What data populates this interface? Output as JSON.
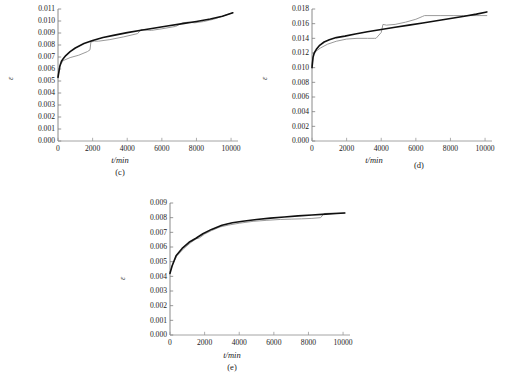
{
  "figure": {
    "background": "#ffffff",
    "curve_colors": {
      "fitted": "#101010",
      "experimental": "#9a9a9a"
    },
    "footer_note": ""
  },
  "chart_data": [
    {
      "id": "c",
      "type": "line",
      "title": "",
      "panel_label": "(c)",
      "xlabel": "t/min",
      "ylabel": "ε",
      "xlim": [
        0,
        10400
      ],
      "ylim": [
        0,
        0.011
      ],
      "grid": false,
      "legend": "none",
      "xticks": [
        0,
        2000,
        4000,
        6000,
        8000,
        10000
      ],
      "xticklabels": [
        "0",
        "2000",
        "4000",
        "6000",
        "8000",
        "10000"
      ],
      "yticks": [
        0,
        0.001,
        0.002,
        0.003,
        0.004,
        0.005,
        0.006,
        0.007,
        0.008,
        0.009,
        0.01,
        0.011
      ],
      "yticklabels": [
        "0.000",
        "0.001",
        "0.002",
        "0.003",
        "0.004",
        "0.005",
        "0.006",
        "0.007",
        "0.008",
        "0.009",
        "0.010",
        "0.011"
      ],
      "series": [
        {
          "name": "experimental",
          "color": "#9a9a9a",
          "x": [
            0,
            120,
            300,
            700,
            1200,
            1700,
            1850,
            1900,
            2100,
            2350,
            3000,
            3800,
            4600,
            4800,
            5000,
            5400,
            6000,
            6800,
            7200,
            7500,
            7900,
            8400,
            9000,
            9600,
            10100
          ],
          "y": [
            0.0054,
            0.0063,
            0.0067,
            0.00695,
            0.00715,
            0.00745,
            0.0076,
            0.00825,
            0.00832,
            0.00832,
            0.00845,
            0.00868,
            0.00895,
            0.0093,
            0.00925,
            0.00922,
            0.00935,
            0.00955,
            0.00985,
            0.0099,
            0.00985,
            0.00995,
            0.01015,
            0.01045,
            0.01068
          ]
        },
        {
          "name": "fitted",
          "color": "#101010",
          "x": [
            0,
            100,
            200,
            300,
            450,
            700,
            1000,
            1500,
            2000,
            2600,
            3200,
            4000,
            4800,
            5600,
            6400,
            7200,
            8000,
            8800,
            9500,
            10100
          ],
          "y": [
            0.0053,
            0.0062,
            0.00665,
            0.00685,
            0.00712,
            0.00745,
            0.00775,
            0.00812,
            0.00838,
            0.00862,
            0.0088,
            0.00903,
            0.00923,
            0.00942,
            0.0096,
            0.00978,
            0.00996,
            0.01016,
            0.0104,
            0.01068
          ]
        }
      ]
    },
    {
      "id": "d",
      "type": "line",
      "title": "",
      "panel_label": "(d)",
      "xlabel": "t/min",
      "ylabel": "ε",
      "xlim": [
        0,
        10400
      ],
      "ylim": [
        0,
        0.018
      ],
      "grid": false,
      "legend": "none",
      "xticks": [
        0,
        2000,
        4000,
        6000,
        8000,
        10000
      ],
      "xticklabels": [
        "0",
        "2000",
        "4000",
        "6000",
        "8000",
        "10000"
      ],
      "yticks": [
        0,
        0.002,
        0.004,
        0.006,
        0.008,
        0.01,
        0.012,
        0.014,
        0.016,
        0.018
      ],
      "yticklabels": [
        "0.000",
        "0.002",
        "0.004",
        "0.006",
        "0.008",
        "0.010",
        "0.012",
        "0.014",
        "0.016",
        "0.018"
      ],
      "series": [
        {
          "name": "experimental",
          "color": "#9a9a9a",
          "x": [
            0,
            80,
            200,
            500,
            900,
            1400,
            2000,
            2600,
            3200,
            3600,
            3700,
            4000,
            4100,
            4300,
            4800,
            5400,
            6000,
            6400,
            6500,
            6700,
            7400,
            8200,
            9000,
            9700,
            10100
          ],
          "y": [
            0.0103,
            0.0119,
            0.0122,
            0.0127,
            0.0132,
            0.0136,
            0.0139,
            0.014,
            0.014,
            0.014,
            0.014,
            0.0148,
            0.0159,
            0.0158,
            0.0159,
            0.0162,
            0.0166,
            0.017,
            0.0171,
            0.0171,
            0.0171,
            0.0171,
            0.0171,
            0.0171,
            0.0171
          ]
        },
        {
          "name": "fitted",
          "color": "#101010",
          "x": [
            0,
            60,
            130,
            250,
            420,
            700,
            1000,
            1400,
            1900,
            2500,
            3200,
            4000,
            4800,
            5600,
            6400,
            7200,
            8000,
            8800,
            9500,
            10100
          ],
          "y": [
            0.01,
            0.0114,
            0.012,
            0.0125,
            0.013,
            0.0135,
            0.0138,
            0.0141,
            0.0143,
            0.0146,
            0.0149,
            0.0152,
            0.0155,
            0.0158,
            0.0161,
            0.0164,
            0.0167,
            0.017,
            0.0173,
            0.0176
          ]
        }
      ]
    },
    {
      "id": "e",
      "type": "line",
      "title": "",
      "panel_label": "(e)",
      "xlabel": "t/min",
      "ylabel": "ε",
      "xlim": [
        0,
        10400
      ],
      "ylim": [
        0,
        0.009
      ],
      "grid": false,
      "legend": "none",
      "xticks": [
        0,
        2000,
        4000,
        6000,
        8000,
        10000
      ],
      "xticklabels": [
        "0",
        "2000",
        "4000",
        "6000",
        "8000",
        "10000"
      ],
      "yticks": [
        0,
        0.001,
        0.002,
        0.003,
        0.004,
        0.005,
        0.006,
        0.007,
        0.008,
        0.009
      ],
      "yticklabels": [
        "0.000",
        "0.001",
        "0.002",
        "0.003",
        "0.004",
        "0.005",
        "0.006",
        "0.007",
        "0.008",
        "0.009"
      ],
      "series": [
        {
          "name": "experimental",
          "color": "#9a9a9a",
          "x": [
            0,
            150,
            400,
            800,
            1200,
            1500,
            1700,
            2000,
            2400,
            2900,
            3400,
            4000,
            4800,
            5600,
            6400,
            7000,
            7600,
            8200,
            8700,
            8900,
            9200,
            9700,
            10100
          ],
          "y": [
            0.0043,
            0.0048,
            0.0054,
            0.0059,
            0.0063,
            0.00655,
            0.00662,
            0.00688,
            0.00712,
            0.00737,
            0.0075,
            0.00762,
            0.00775,
            0.00782,
            0.00788,
            0.0079,
            0.00792,
            0.00795,
            0.008,
            0.00828,
            0.0083,
            0.00831,
            0.00832
          ]
        },
        {
          "name": "fitted",
          "color": "#101010",
          "x": [
            0,
            120,
            350,
            700,
            1100,
            1500,
            1900,
            2400,
            3000,
            3600,
            4200,
            5000,
            5800,
            6600,
            7400,
            8200,
            9000,
            9600,
            10100
          ],
          "y": [
            0.0042,
            0.0047,
            0.0054,
            0.0059,
            0.00632,
            0.0066,
            0.0069,
            0.0072,
            0.00748,
            0.00765,
            0.00775,
            0.00788,
            0.00797,
            0.00805,
            0.00812,
            0.00818,
            0.00824,
            0.00828,
            0.00832
          ]
        }
      ]
    }
  ]
}
